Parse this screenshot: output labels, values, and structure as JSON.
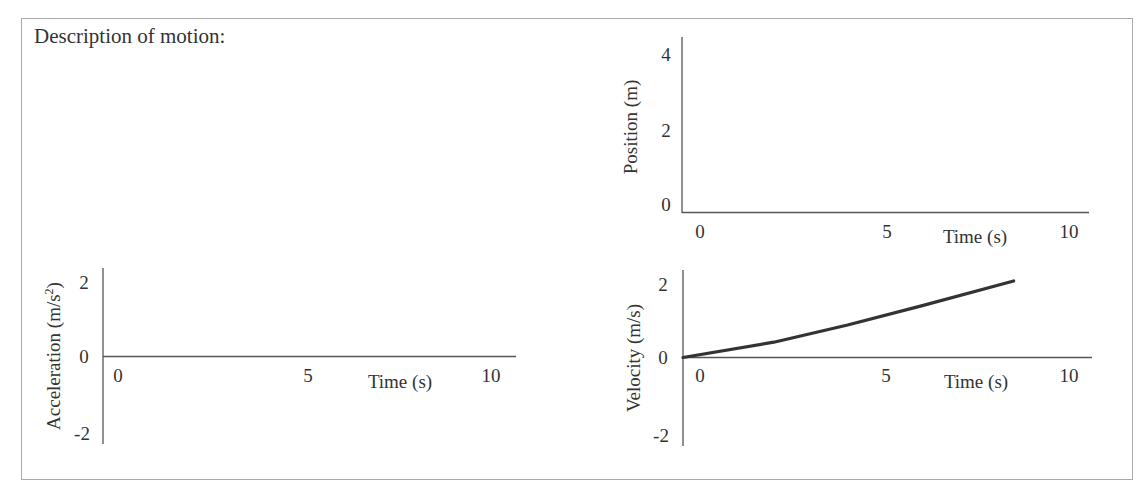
{
  "description_label": "Description of motion:",
  "colors": {
    "axis": "#555555",
    "line": "#333333",
    "frame": "#aaaaaa",
    "text": "#333333"
  },
  "chart_data": [
    {
      "id": "position",
      "type": "line",
      "title": "",
      "xlabel": "Time (s)",
      "ylabel": "Position (m)",
      "x_ticks": [
        "0",
        "5",
        "10"
      ],
      "y_ticks": [
        "0",
        "2",
        "4"
      ],
      "xlim": [
        0,
        10
      ],
      "ylim": [
        0,
        4
      ],
      "grid": false,
      "series": []
    },
    {
      "id": "acceleration",
      "type": "line",
      "title": "",
      "xlabel": "Time (s)",
      "ylabel": "Acceleration (m/s²)",
      "ylabel_main": "Acceleration (m/s",
      "ylabel_sup": "2",
      "ylabel_tail": ")",
      "x_ticks": [
        "0",
        "5",
        "10"
      ],
      "y_ticks": [
        "-2",
        "0",
        "2"
      ],
      "xlim": [
        0,
        10
      ],
      "ylim": [
        -2,
        2
      ],
      "grid": false,
      "series": []
    },
    {
      "id": "velocity",
      "type": "line",
      "title": "",
      "xlabel": "Time (s)",
      "ylabel": "Velocity (m/s)",
      "x_ticks": [
        "0",
        "5",
        "10"
      ],
      "y_ticks": [
        "-2",
        "0",
        "2"
      ],
      "xlim": [
        0,
        10
      ],
      "ylim": [
        -2,
        2
      ],
      "grid": false,
      "series": [
        {
          "name": "velocity",
          "x": [
            0,
            2,
            4,
            6,
            8.5
          ],
          "y": [
            0,
            0.4,
            0.85,
            1.35,
            2.0
          ]
        }
      ]
    }
  ]
}
